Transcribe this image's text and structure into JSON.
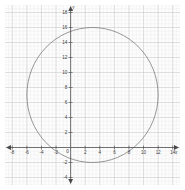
{
  "chart_data": {
    "type": "line",
    "title": "",
    "subtitle": "",
    "xlabel": "x",
    "ylabel": "y",
    "xlim": [
      -9,
      15
    ],
    "ylim": [
      -5,
      19
    ],
    "grid": true,
    "minor_grid": true,
    "minor_grid_step": 0.5,
    "major_grid_step": 2,
    "legend": null,
    "legend_position": "none",
    "xticks": [
      -8,
      -6,
      -4,
      -2,
      0,
      2,
      4,
      6,
      8,
      10,
      12,
      14
    ],
    "xtick_labels": [
      "-8",
      "-6",
      "-4",
      "-2",
      "0",
      "2",
      "4",
      "6",
      "8",
      "10",
      "12",
      "14"
    ],
    "yticks": [
      -4,
      -2,
      2,
      4,
      6,
      8,
      10,
      12,
      14,
      16,
      18
    ],
    "ytick_labels": [
      "-4",
      "-2",
      "2",
      "4",
      "6",
      "8",
      "10",
      "12",
      "14",
      "16",
      "18"
    ],
    "origin_label": "0",
    "series": [
      {
        "name": "circle",
        "shape": "circle",
        "center_x": 3,
        "center_y": 7,
        "radius": 9,
        "color": "#6b6b6b",
        "line_width": 0.7,
        "fill": "none",
        "top_point_y": 16,
        "bottom_point_y": -2,
        "left_point_x": -6,
        "right_point_x": 12,
        "x_intercepts": [
          -2.94,
          8.94
        ],
        "y_intercepts": [
          -1.49,
          15.49
        ]
      }
    ],
    "annotations": [],
    "axis_color": "#4a4a4a",
    "grid_major_color": "#c9c9c9",
    "grid_minor_color": "#e9e9e9",
    "background_color": "#fdfdfd",
    "arrows": {
      "x_positive": true,
      "x_negative": true,
      "y_positive": true,
      "y_negative": true
    }
  }
}
